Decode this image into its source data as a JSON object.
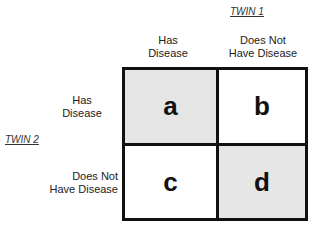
{
  "twin1": {
    "label": "TWIN 1",
    "columns": [
      {
        "line1": "Has",
        "line2": "Disease"
      },
      {
        "line1": "Does Not",
        "line2": "Have Disease"
      }
    ]
  },
  "twin2": {
    "label": "TWIN 2",
    "rows": [
      {
        "line1": "Has",
        "line2": "Disease"
      },
      {
        "line1": "Does Not",
        "line2": "Have Disease"
      }
    ]
  },
  "cells": [
    {
      "label": "a",
      "shaded": true
    },
    {
      "label": "b",
      "shaded": false
    },
    {
      "label": "c",
      "shaded": false
    },
    {
      "label": "d",
      "shaded": true
    }
  ],
  "colors": {
    "shaded": "#e6e6e6",
    "unshaded": "#ffffff",
    "border": "#111111"
  }
}
